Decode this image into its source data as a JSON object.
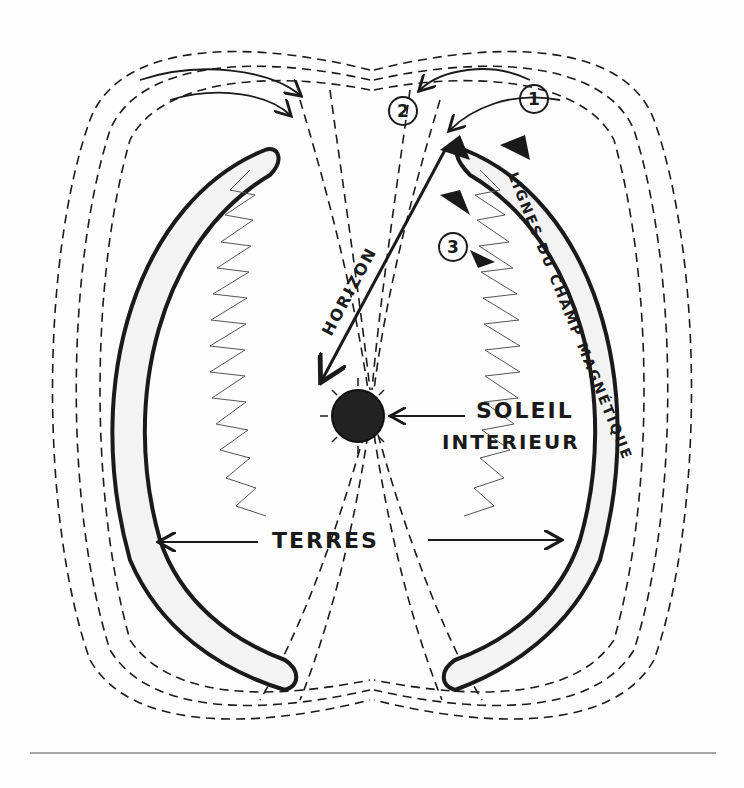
{
  "diagram": {
    "labels": {
      "field_lines": "LIGNES DU CHAMP MAGNÉTIQUE",
      "horizon": "HORIZON",
      "sun_line1": "SOLEIL",
      "sun_line2": "INTERIEUR",
      "earths": "TERRES"
    },
    "markers": [
      "1",
      "2",
      "3"
    ],
    "colors": {
      "ink": "#1a1a1a",
      "paper": "#fdfdfd",
      "hatch": "#555555"
    }
  }
}
